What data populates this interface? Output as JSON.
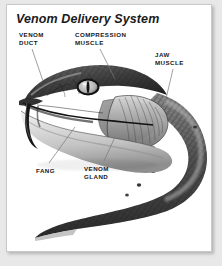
{
  "figure": {
    "title": "Venom Delivery System",
    "background_color": "#ffffff",
    "page_background_color": "#e8e8e8",
    "border_color": "#c9c9c9"
  },
  "labels": [
    {
      "id": "venom-duct",
      "line1": "VENOM",
      "line2": "DUCT"
    },
    {
      "id": "compression",
      "line1": "COMPRESSION",
      "line2": "MUSCLE"
    },
    {
      "id": "jaw",
      "line1": "JAW",
      "line2": "MUSCLE"
    },
    {
      "id": "fang",
      "line1": "FANG",
      "line2": ""
    },
    {
      "id": "venom-gland",
      "line1": "VENOM",
      "line2": "GLAND"
    }
  ],
  "colors": {
    "label_text": "#171717",
    "title_text": "#1a1a1a",
    "leader_line": "#777777",
    "snake_dark": "#2b2b2b",
    "snake_mid": "#777777",
    "snake_light": "#cfcfcf"
  }
}
